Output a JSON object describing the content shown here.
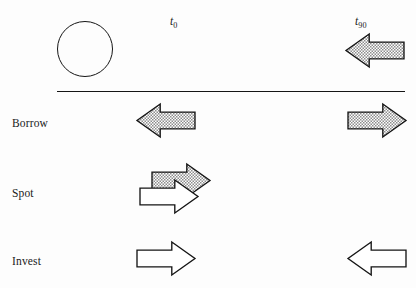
{
  "diagram": {
    "background_color": "#fdfdfd",
    "line_color": "#151515",
    "hatch_fill_color": "#9a9a9a",
    "white_fill_color": "#ffffff"
  },
  "timeline": {
    "labels": [
      {
        "name": "t0",
        "base": "t",
        "subscript": "0",
        "x": 170,
        "y": 16
      },
      {
        "name": "t90",
        "base": "t",
        "subscript": "90",
        "x": 355,
        "y": 16
      }
    ],
    "divider": {
      "x": 57,
      "y": 91,
      "width": 348
    }
  },
  "header": {
    "circle": {
      "cx": 85,
      "cy": 49,
      "r": 28
    },
    "arrow": {
      "name": "header-inflow-arrow",
      "direction": "left",
      "fill": "hatch",
      "x": 346,
      "y": 34,
      "width": 58,
      "height": 33
    }
  },
  "rows": [
    {
      "name": "borrow",
      "label": "Borrow",
      "label_x": 12,
      "label_y": 118,
      "arrows": [
        {
          "name": "borrow-left-arrow",
          "direction": "left",
          "fill": "hatch",
          "x": 137,
          "y": 104,
          "width": 58,
          "height": 33
        },
        {
          "name": "borrow-right-arrow",
          "direction": "right",
          "fill": "hatch",
          "x": 348,
          "y": 104,
          "width": 58,
          "height": 33
        }
      ]
    },
    {
      "name": "spot",
      "label": "Spot",
      "label_x": 12,
      "label_y": 188,
      "arrows": [
        {
          "name": "spot-back-arrow",
          "direction": "right",
          "fill": "hatch",
          "x": 152,
          "y": 164,
          "width": 58,
          "height": 33
        },
        {
          "name": "spot-front-arrow",
          "direction": "right",
          "fill": "white",
          "x": 140,
          "y": 180,
          "width": 58,
          "height": 33
        }
      ]
    },
    {
      "name": "invest",
      "label": "Invest",
      "label_x": 12,
      "label_y": 256,
      "arrows": [
        {
          "name": "invest-left-arrow",
          "direction": "right",
          "fill": "white",
          "x": 137,
          "y": 242,
          "width": 58,
          "height": 33
        },
        {
          "name": "invest-right-arrow",
          "direction": "left",
          "fill": "white",
          "x": 348,
          "y": 242,
          "width": 58,
          "height": 33
        }
      ]
    }
  ]
}
